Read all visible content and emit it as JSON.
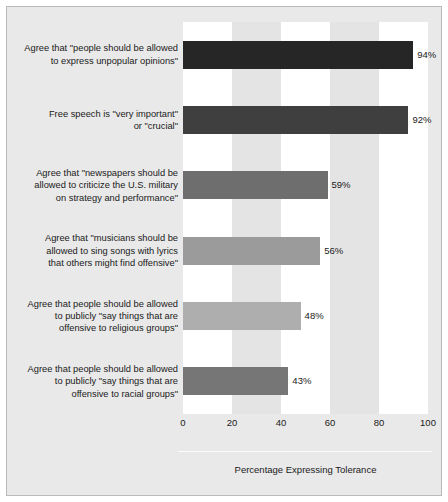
{
  "figure": {
    "background_color": "#e9e9e9",
    "border_color": "#b9b9b9",
    "plot_band_light": "#ffffff",
    "plot_band_dark": "#e4e4e4"
  },
  "chart_data": {
    "type": "bar",
    "orientation": "horizontal",
    "title": "",
    "subtitle": "",
    "xlabel": "Percentage Expressing Tolerance",
    "ylabel": "",
    "xlim": [
      0,
      100
    ],
    "xticks": [
      "0",
      "20",
      "40",
      "60",
      "80",
      "100"
    ],
    "xtick_values": [
      0,
      20,
      40,
      60,
      80,
      100
    ],
    "grid": false,
    "alternating_bands": true,
    "legend": null,
    "categories": [
      "Agree that \"people should be allowed\nto express unpopular opinions\"",
      "Free speech is \"very important\"\nor \"crucial\"",
      "Agree that \"newspapers should be\nallowed to criticize the U.S. military\non strategy and performance\"",
      "Agree that \"musicians should be\nallowed to sing songs with lyrics\nthat others might find offensive\"",
      "Agree that people should be allowed\nto publicly \"say things that are\noffensive to religious groups\"",
      "Agree that people should be allowed\nto publicly \"say things that are\noffensive to racial groups\""
    ],
    "values": [
      94,
      92,
      59,
      56,
      48,
      43
    ],
    "value_labels": [
      "94%",
      "92%",
      "59%",
      "56%",
      "48%",
      "43%"
    ],
    "bar_colors": [
      "#262626",
      "#3f3f3f",
      "#6e6e6e",
      "#9b9b9b",
      "#aeaeae",
      "#767676"
    ]
  }
}
